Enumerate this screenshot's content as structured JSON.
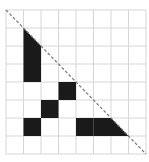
{
  "diagram": {
    "grid": {
      "cols": 8,
      "rows": 8,
      "x0": 6,
      "y0": 10,
      "cell_w": 17.5,
      "cell_h": 18,
      "line_color": "#d6d6d6"
    },
    "fill_color": "#1a1a1a",
    "diagonal": {
      "from": [
        6,
        10
      ],
      "to": [
        146,
        154
      ],
      "color": "#777777",
      "style": "dashed"
    },
    "filled_cells": [
      {
        "col": 1,
        "row": 1,
        "shape": "triangle-lower-left"
      },
      {
        "col": 1,
        "row": 2,
        "shape": "square"
      },
      {
        "col": 1,
        "row": 3,
        "shape": "square"
      },
      {
        "col": 3,
        "row": 4,
        "shape": "square"
      },
      {
        "col": 2,
        "row": 5,
        "shape": "square"
      },
      {
        "col": 1,
        "row": 6,
        "shape": "square"
      },
      {
        "col": 4,
        "row": 6,
        "shape": "square"
      },
      {
        "col": 5,
        "row": 6,
        "shape": "square"
      },
      {
        "col": 6,
        "row": 6,
        "shape": "triangle-lower-left"
      }
    ]
  }
}
